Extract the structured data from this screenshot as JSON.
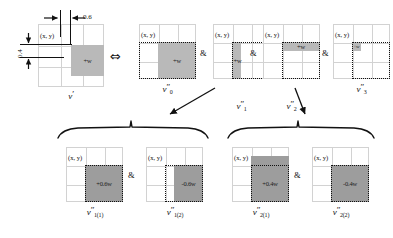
{
  "diagram": {
    "symbols": {
      "iff": "⇔",
      "amp": "&"
    },
    "measures": {
      "horizontal": "0.6",
      "vertical": "0.4"
    },
    "coord_tag": "(x, y)",
    "source_panel": {
      "name": "source-panel",
      "caption_base": "v",
      "caption_prime": "′",
      "block_label": "+w"
    },
    "top_panels": [
      {
        "id": "v0",
        "caption_base": "v",
        "caption_prime": "″",
        "caption_sub": "0",
        "block_label": "+w",
        "block_shade": "light"
      },
      {
        "id": "v1",
        "caption_base": "v",
        "caption_prime": "″",
        "caption_sub": "1",
        "block_label": "+w",
        "block_shade": "light"
      },
      {
        "id": "v2",
        "caption_base": "v",
        "caption_prime": "″",
        "caption_sub": "2",
        "block_label": "+w",
        "block_shade": "light"
      },
      {
        "id": "v3",
        "caption_base": "v",
        "caption_prime": "″",
        "caption_sub": "3",
        "block_label": "+w",
        "block_shade": "light"
      }
    ],
    "bottom_panels": [
      {
        "id": "v1_1",
        "caption_base": "v",
        "caption_prime": "″",
        "caption_sub": "1(1)",
        "block_label": "+0.6w",
        "block_shade": "dark"
      },
      {
        "id": "v1_2",
        "caption_base": "v",
        "caption_prime": "″",
        "caption_sub": "1(2)",
        "block_label": "-0.6w",
        "block_shade": "dark"
      },
      {
        "id": "v2_1",
        "caption_base": "v",
        "caption_prime": "″",
        "caption_sub": "2(1)",
        "block_label": "+0.4w",
        "block_shade": "dark"
      },
      {
        "id": "v2_2",
        "caption_base": "v",
        "caption_prime": "″",
        "caption_sub": "2(2)",
        "block_label": "-0.4w",
        "block_shade": "dark"
      }
    ],
    "colors": {
      "grid_line": "#d2d2d2",
      "block_light": "#b9b9b9",
      "block_dark": "#9d9d9d",
      "ink": "#111111",
      "background": "#ffffff"
    }
  }
}
